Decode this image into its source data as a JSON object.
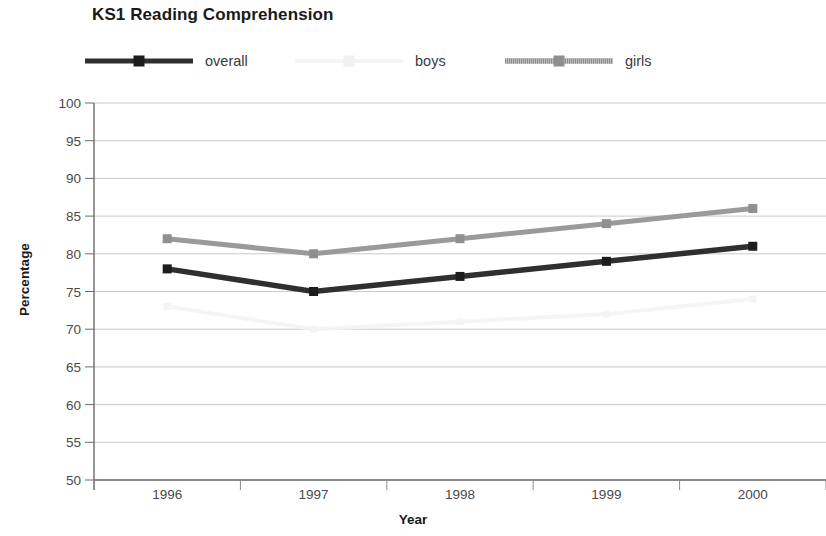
{
  "chart_data": {
    "type": "line",
    "title": "KS1 Reading Comprehension",
    "xlabel": "Year",
    "ylabel": "Percentage",
    "categories": [
      "1996",
      "1997",
      "1998",
      "1999",
      "2000"
    ],
    "x": [
      1996,
      1997,
      1998,
      1999,
      2000
    ],
    "ylim": [
      50,
      100
    ],
    "yticks": [
      50,
      55,
      60,
      65,
      70,
      75,
      80,
      85,
      90,
      95,
      100
    ],
    "ytick_labels": [
      "50",
      "55",
      "60",
      "65",
      "70",
      "75",
      "80",
      "85",
      "90",
      "95",
      "100"
    ],
    "grid": "horizontal",
    "legend_position": "top",
    "series": [
      {
        "name": "overall",
        "values": [
          78,
          75,
          77,
          79,
          81
        ],
        "color": "#2f2f2f",
        "marker": "square",
        "style": "solid-thick"
      },
      {
        "name": "boys",
        "values": [
          73,
          70,
          71,
          72,
          74
        ],
        "color": "#f4f4f4",
        "marker": "square",
        "style": "solid-faint",
        "note": "line rendered almost white in source image; nearly invisible"
      },
      {
        "name": "girls",
        "values": [
          82,
          80,
          82,
          84,
          86
        ],
        "color": "#9a9a9a",
        "marker": "square",
        "style": "textured-gray"
      }
    ]
  },
  "legend": {
    "items": [
      {
        "label": "overall",
        "swatch": "overall-line-swatch"
      },
      {
        "label": "boys",
        "swatch": "boys-line-swatch"
      },
      {
        "label": "girls",
        "swatch": "girls-line-swatch"
      }
    ]
  },
  "axes": {
    "y_title": "Percentage",
    "x_title": "Year"
  }
}
